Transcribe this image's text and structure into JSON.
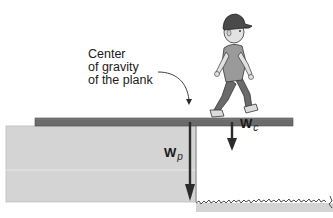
{
  "diagram": {
    "annotation": {
      "lines": [
        "Center",
        "of gravity",
        "of the plank"
      ]
    },
    "vectors": {
      "plank_weight": {
        "symbol": "W",
        "subscript": "p"
      },
      "child_weight": {
        "symbol": "W",
        "subscript": "c"
      }
    },
    "colors": {
      "plank": "#6b6b6b",
      "ledge": "#d4d4d4",
      "arrow": "#2b2b2b",
      "grass": "#d4d4d4",
      "background": "#ffffff"
    }
  }
}
